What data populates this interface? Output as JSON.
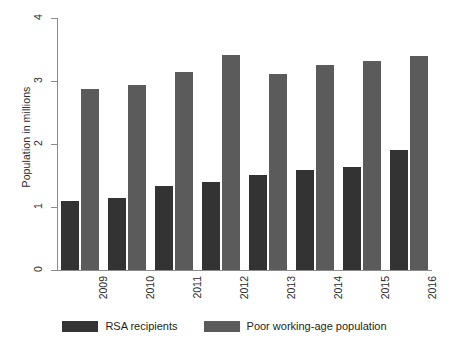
{
  "chart_data": {
    "type": "bar",
    "title": "",
    "subtitle": "",
    "xlabel": "",
    "ylabel": "Population in millions",
    "categories": [
      "2009",
      "2010",
      "2011",
      "2012",
      "2013",
      "2014",
      "2015",
      "2016"
    ],
    "series": [
      {
        "name": "RSA recipients",
        "color": "#333333",
        "values": [
          1.1,
          1.15,
          1.33,
          1.4,
          1.51,
          1.59,
          1.64,
          1.9
        ]
      },
      {
        "name": "Poor working-age population",
        "color": "#5b5b5b",
        "values": [
          2.88,
          2.94,
          3.15,
          3.42,
          3.11,
          3.26,
          3.31,
          3.39
        ]
      }
    ],
    "ylim": [
      0,
      4
    ],
    "yticks": [
      0,
      1,
      2,
      3,
      4
    ],
    "ytick_labels": [
      "0",
      "1",
      "2",
      "3",
      "4"
    ],
    "grid": false,
    "legend_position": "bottom",
    "axis_color": "#8c8c8c",
    "background": "#ffffff"
  }
}
